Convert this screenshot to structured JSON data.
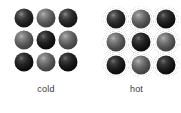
{
  "diagram": {
    "background_color": "#ffffff",
    "label_color": "#3a3a3a",
    "groups": [
      {
        "id": "cold",
        "label": "cold",
        "state": "cold",
        "rows": 3,
        "columns": 3,
        "particle_count": 9,
        "spacing": "tight",
        "motion": "slight vibration",
        "halo_style": "thin-halo",
        "particles": [
          {
            "row": 1,
            "column": 1,
            "shade": "dark"
          },
          {
            "row": 1,
            "column": 2,
            "shade": "mid"
          },
          {
            "row": 1,
            "column": 3,
            "shade": "dark"
          },
          {
            "row": 2,
            "column": 1,
            "shade": "mid"
          },
          {
            "row": 2,
            "column": 2,
            "shade": "deep"
          },
          {
            "row": 2,
            "column": 3,
            "shade": "mid"
          },
          {
            "row": 3,
            "column": 1,
            "shade": "deep"
          },
          {
            "row": 3,
            "column": 2,
            "shade": "mid"
          },
          {
            "row": 3,
            "column": 3,
            "shade": "deep"
          }
        ]
      },
      {
        "id": "hot",
        "label": "hot",
        "state": "hot",
        "rows": 3,
        "columns": 3,
        "particle_count": 9,
        "spacing": "wide",
        "motion": "rapid vibration",
        "halo_style": "concentric-rings",
        "particles": [
          {
            "row": 1,
            "column": 1,
            "shade": "dark"
          },
          {
            "row": 1,
            "column": 2,
            "shade": "mid"
          },
          {
            "row": 1,
            "column": 3,
            "shade": "deep"
          },
          {
            "row": 2,
            "column": 1,
            "shade": "mid"
          },
          {
            "row": 2,
            "column": 2,
            "shade": "deep"
          },
          {
            "row": 2,
            "column": 3,
            "shade": "mid"
          },
          {
            "row": 3,
            "column": 1,
            "shade": "deep"
          },
          {
            "row": 3,
            "column": 2,
            "shade": "mid"
          },
          {
            "row": 3,
            "column": 3,
            "shade": "deep"
          }
        ]
      }
    ]
  }
}
